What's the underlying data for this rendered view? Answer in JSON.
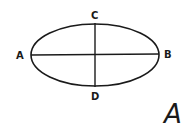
{
  "diagram": {
    "shape": "ellipse",
    "major_axis": {
      "from": "A",
      "to": "B"
    },
    "minor_axis": {
      "from": "C",
      "to": "D"
    },
    "labels": {
      "left": "A",
      "right": "B",
      "top": "C",
      "bottom": "D"
    },
    "figure_label": "A",
    "stroke_color": "#1a1a1a"
  }
}
